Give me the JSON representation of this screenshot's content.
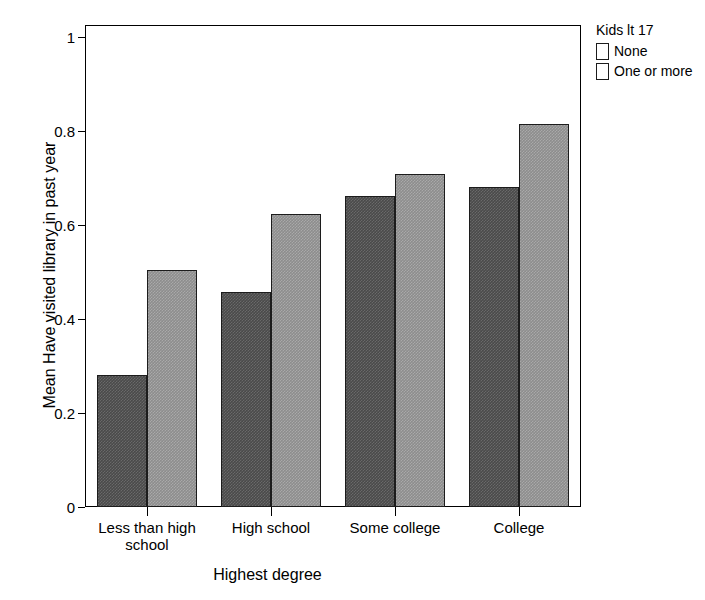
{
  "chart_data": {
    "type": "bar",
    "title": "",
    "xlabel": "Highest degree",
    "ylabel": "Mean Have visited library in past year",
    "categories": [
      "Less than high\nschool",
      "High school",
      "Some college",
      "College"
    ],
    "series": [
      {
        "name": "None",
        "values": [
          0.28,
          0.457,
          0.662,
          0.681
        ],
        "color": "#4a4a4a"
      },
      {
        "name": "One or more",
        "values": [
          0.505,
          0.623,
          0.708,
          0.815
        ],
        "color": "#8d8d8d"
      }
    ],
    "ylim": [
      0,
      1.05
    ],
    "yticks": [
      0,
      0.2,
      0.4,
      0.6,
      0.8,
      1
    ],
    "ytick_labels": [
      "0",
      "0.2",
      "0.4",
      "0.6",
      "0.8",
      "1"
    ],
    "grid": false,
    "legend": {
      "title": "Kids lt 17",
      "position": "top-right",
      "entries": [
        "None",
        "One or more"
      ]
    }
  },
  "legend": {
    "title": "Kids lt 17",
    "items": [
      {
        "label": "None"
      },
      {
        "label": "One or more"
      }
    ]
  },
  "axes": {
    "y_title": "Mean Have visited library in past year",
    "x_title": "Highest degree"
  }
}
